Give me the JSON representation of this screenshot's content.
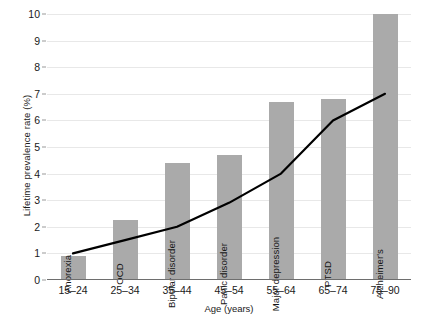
{
  "chart_data": {
    "type": "bar",
    "title": "",
    "xlabel": "Age (years)",
    "ylabel": "Lifetime prevalence rate (%)",
    "categories": [
      "15–24",
      "25–34",
      "35–44",
      "45–54",
      "55–64",
      "65–74",
      "75–90"
    ],
    "ylim": [
      0,
      10
    ],
    "yticks": [
      0,
      1,
      2,
      3,
      4,
      5,
      6,
      7,
      8,
      9,
      10
    ],
    "ytick_labels": [
      "0",
      "1",
      "2",
      "3",
      "4",
      "5",
      "6",
      "7",
      "8",
      "9",
      "10"
    ],
    "grid": true,
    "legend": "none",
    "series": [
      {
        "name": "Lifetime prevalence rate",
        "type": "bar",
        "color": "#aaaaaa",
        "values": [
          0.9,
          2.25,
          4.4,
          4.7,
          6.7,
          6.8,
          10.0
        ],
        "point_labels": [
          "Anorexia",
          "OCD",
          "Bipolar disorder",
          "Panic disorder",
          "Major depression",
          "PTSD",
          "Alzheimer's"
        ]
      },
      {
        "name": "Trend line",
        "type": "line",
        "color": "#000000",
        "values": [
          1.0,
          1.5,
          2.0,
          2.9,
          4.0,
          6.0,
          7.0
        ]
      }
    ]
  }
}
